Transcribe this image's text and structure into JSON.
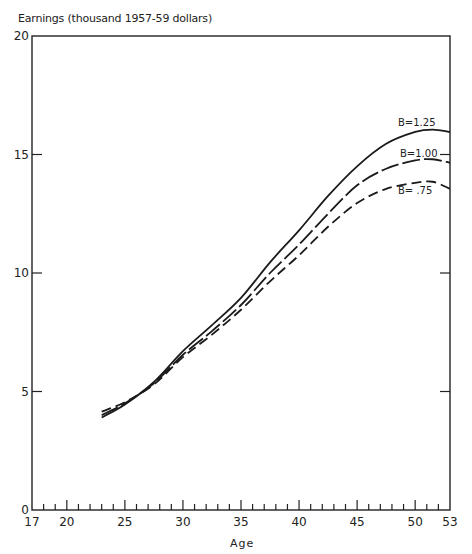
{
  "chart_data": {
    "type": "line",
    "title": "",
    "ylabel": "Earnings (thousand 1957-59 dollars)",
    "xlabel": "Age",
    "xlim": [
      17,
      53
    ],
    "ylim": [
      0,
      20
    ],
    "grid": false,
    "legend": "inline labels at right end of curves",
    "x_ticks": [
      17,
      20,
      25,
      30,
      35,
      40,
      45,
      50,
      53
    ],
    "y_ticks": [
      0,
      5,
      10,
      15,
      20
    ],
    "x": [
      23,
      25,
      27.5,
      30,
      32.5,
      35,
      37.5,
      40,
      42.5,
      45,
      47.5,
      50,
      51.5,
      53
    ],
    "series": [
      {
        "name": "B=1.25",
        "style": "solid",
        "values": [
          3.9,
          4.45,
          5.4,
          6.7,
          7.8,
          8.95,
          10.45,
          11.8,
          13.25,
          14.5,
          15.45,
          15.95,
          16.05,
          15.95
        ]
      },
      {
        "name": "B=1.00",
        "style": "long-dash",
        "values": [
          4.0,
          4.5,
          5.35,
          6.55,
          7.55,
          8.65,
          10.0,
          11.2,
          12.5,
          13.7,
          14.4,
          14.75,
          14.8,
          14.65
        ]
      },
      {
        "name": "B= .75",
        "style": "dash",
        "values": [
          4.15,
          4.55,
          5.3,
          6.45,
          7.4,
          8.45,
          9.65,
          10.75,
          11.95,
          12.95,
          13.55,
          13.8,
          13.85,
          13.55
        ]
      }
    ]
  },
  "labels": {
    "ytitle": "Earnings (thousand 1957-59 dollars)",
    "xtitle": "Age",
    "curve_b125": "B=1.25",
    "curve_b100": "B=1.00",
    "curve_b075": "B= .75"
  }
}
